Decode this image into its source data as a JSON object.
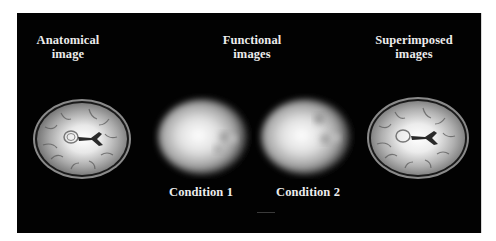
{
  "figure": {
    "background_color": "#020202",
    "text_color": "#ececec",
    "columns": [
      {
        "id": "anatomical",
        "title_lines": [
          "Anatomical",
          "image"
        ],
        "image_type": "anatomical-mri-axial-slice"
      },
      {
        "id": "functional",
        "title_lines": [
          "Functional",
          "images"
        ],
        "image_type": "functional-activation-maps",
        "conditions": [
          "Condition 1",
          "Condition 2"
        ]
      },
      {
        "id": "superimposed",
        "title_lines": [
          "Superimposed",
          "images"
        ],
        "image_type": "superimposed-mri-axial-slice"
      }
    ]
  }
}
